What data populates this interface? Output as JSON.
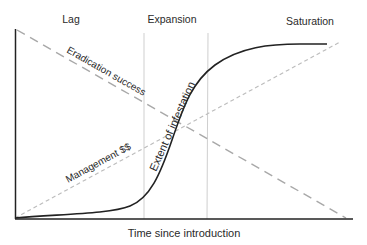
{
  "diagram": {
    "phases": [
      {
        "label": "Lag"
      },
      {
        "label": "Expansion"
      },
      {
        "label": "Saturation"
      }
    ],
    "x_axis_label": "Time since introduction",
    "curves": {
      "infestation": {
        "label": "Extent of infestation",
        "style": "solid",
        "color": "#222222"
      },
      "eradication": {
        "label": "Eradication success",
        "style": "dashed",
        "color": "#a8a8a8"
      },
      "management": {
        "label": "Management $$",
        "style": "dashed",
        "color": "#b8b8b8"
      }
    },
    "colors": {
      "axis": "#222222",
      "phase_divider": "#cfcfcf",
      "text": "#2a2a2a"
    }
  }
}
